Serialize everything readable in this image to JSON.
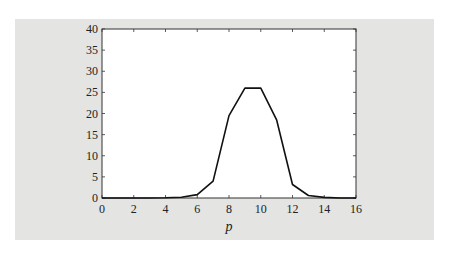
{
  "chart_data": {
    "type": "line",
    "title": "",
    "xlabel": "p",
    "ylabel": "",
    "xlim": [
      0,
      16
    ],
    "ylim": [
      0,
      40
    ],
    "x_ticks": [
      0,
      2,
      4,
      6,
      8,
      10,
      12,
      14,
      16
    ],
    "y_ticks": [
      0,
      5,
      10,
      15,
      20,
      25,
      30,
      35,
      40
    ],
    "grid": false,
    "legend": null,
    "series": [
      {
        "name": "",
        "color": "#111111",
        "x": [
          0,
          1,
          2,
          3,
          4,
          5,
          6,
          7,
          8,
          9,
          10,
          11,
          12,
          13,
          14,
          15,
          16
        ],
        "y": [
          0,
          0,
          0,
          0,
          0.05,
          0.2,
          0.8,
          4,
          19.5,
          26,
          26,
          18.5,
          3.2,
          0.6,
          0.15,
          0,
          0
        ]
      }
    ]
  },
  "colors": {
    "panel_background": "#e4e4e2",
    "plot_background": "#ffffff",
    "line": "#111111"
  }
}
